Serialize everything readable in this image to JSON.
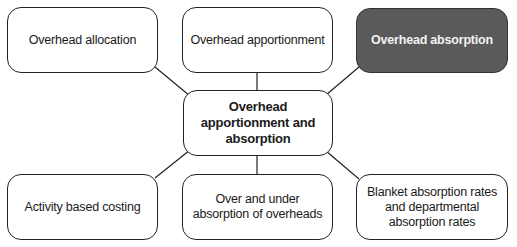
{
  "diagram": {
    "type": "mind-map",
    "center": {
      "label": "Overhead apportionment and absorption"
    },
    "nodes": [
      {
        "id": "top-left",
        "label": "Overhead allocation",
        "highlighted": false
      },
      {
        "id": "top-middle",
        "label": "Overhead apportionment",
        "highlighted": false
      },
      {
        "id": "top-right",
        "label": "Overhead absorption",
        "highlighted": true
      },
      {
        "id": "bottom-left",
        "label": "Activity based costing",
        "highlighted": false
      },
      {
        "id": "bottom-middle",
        "label": "Over and under absorption of overheads",
        "highlighted": false
      },
      {
        "id": "bottom-right",
        "label": "Blanket absorption rates and departmental absorption rates",
        "highlighted": false
      }
    ],
    "colors": {
      "highlight_fill": "#5a5a5a",
      "highlight_text": "#f2f2f2",
      "border": "#222222"
    }
  }
}
